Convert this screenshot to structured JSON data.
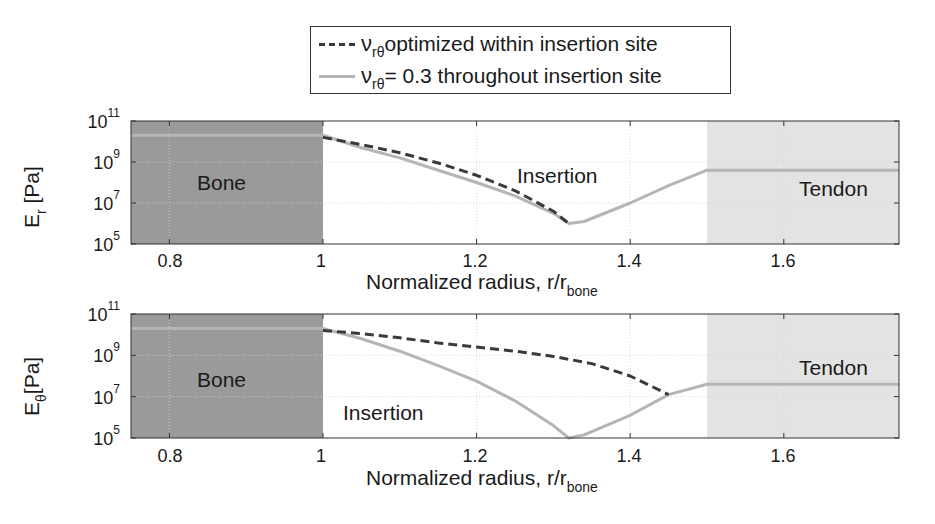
{
  "legend": {
    "entries": [
      {
        "symbol": "ν",
        "subscript": "rθ",
        "text": " optimized within insertion site",
        "style": "dashed",
        "color": "#3a3a3a"
      },
      {
        "symbol": "ν",
        "subscript": "rθ",
        "text": " = 0.3 throughout insertion site",
        "style": "solid",
        "color": "#b5b5b5"
      }
    ]
  },
  "colors": {
    "bone": "#9a9a9a",
    "tendon": "#e3e3e3",
    "dashed": "#3a3a3a",
    "solid": "#b5b5b5",
    "axis": "#333333",
    "grid": "#cfcfcf"
  },
  "panels": [
    {
      "ylabel_main": "E",
      "ylabel_sub": "r",
      "ylabel_unit": " [Pa]",
      "xlabel_main": "Normalized radius, r/r",
      "xlabel_sub": "bone",
      "y_ticks": [
        {
          "base": "10",
          "exp": "11"
        },
        {
          "base": "10",
          "exp": "9"
        },
        {
          "base": "10",
          "exp": "7"
        },
        {
          "base": "10",
          "exp": "5"
        }
      ],
      "x_ticks": [
        "0.8",
        "1",
        "1.2",
        "1.4",
        "1.6"
      ],
      "regions": {
        "bone": "Bone",
        "insertion": "Insertion",
        "tendon": "Tendon"
      }
    },
    {
      "ylabel_main": "E",
      "ylabel_sub": "θ",
      "ylabel_unit": "[Pa]",
      "xlabel_main": "Normalized radius, r/r",
      "xlabel_sub": "bone",
      "y_ticks": [
        {
          "base": "10",
          "exp": "11"
        },
        {
          "base": "10",
          "exp": "9"
        },
        {
          "base": "10",
          "exp": "7"
        },
        {
          "base": "10",
          "exp": "5"
        }
      ],
      "x_ticks": [
        "0.8",
        "1",
        "1.2",
        "1.4",
        "1.6"
      ],
      "regions": {
        "bone": "Bone",
        "insertion": "Insertion",
        "tendon": "Tendon"
      }
    }
  ],
  "chart_data": [
    {
      "type": "line",
      "title": "",
      "xlabel": "Normalized radius, r/r_bone",
      "ylabel": "E_r [Pa]",
      "yscale": "log",
      "xlim": [
        0.75,
        1.75
      ],
      "ylim": [
        100000.0,
        100000000000.0
      ],
      "grid": true,
      "legend_position": "top",
      "shaded_regions": [
        {
          "label": "Bone",
          "x": [
            0.75,
            1.0
          ],
          "color": "#9a9a9a"
        },
        {
          "label": "Tendon",
          "x": [
            1.5,
            1.75
          ],
          "color": "#e3e3e3"
        }
      ],
      "annotations": [
        "Bone",
        "Insertion",
        "Tendon"
      ],
      "series": [
        {
          "name": "ν_rθ optimized within insertion site",
          "style": "dashed",
          "x": [
            1.0,
            1.05,
            1.1,
            1.15,
            1.2,
            1.25,
            1.3,
            1.32
          ],
          "log10_y": [
            10.2,
            9.85,
            9.45,
            8.95,
            8.35,
            7.6,
            6.6,
            6.0
          ]
        },
        {
          "name": "ν_rθ = 0.3 throughout insertion site",
          "style": "solid",
          "x": [
            0.75,
            1.0,
            1.05,
            1.1,
            1.15,
            1.2,
            1.25,
            1.3,
            1.32,
            1.34,
            1.4,
            1.45,
            1.5,
            1.75
          ],
          "log10_y": [
            10.3,
            10.3,
            9.7,
            9.2,
            8.6,
            8.0,
            7.35,
            6.5,
            6.0,
            6.1,
            7.0,
            7.85,
            8.6,
            8.6
          ]
        }
      ]
    },
    {
      "type": "line",
      "title": "",
      "xlabel": "Normalized radius, r/r_bone",
      "ylabel": "E_θ [Pa]",
      "yscale": "log",
      "xlim": [
        0.75,
        1.75
      ],
      "ylim": [
        100000.0,
        100000000000.0
      ],
      "grid": true,
      "shaded_regions": [
        {
          "label": "Bone",
          "x": [
            0.75,
            1.0
          ],
          "color": "#9a9a9a"
        },
        {
          "label": "Tendon",
          "x": [
            1.5,
            1.75
          ],
          "color": "#e3e3e3"
        }
      ],
      "annotations": [
        "Bone",
        "Insertion",
        "Tendon"
      ],
      "series": [
        {
          "name": "ν_rθ optimized within insertion site",
          "style": "dashed",
          "x": [
            1.0,
            1.05,
            1.1,
            1.15,
            1.2,
            1.25,
            1.3,
            1.35,
            1.4,
            1.45
          ],
          "log10_y": [
            10.2,
            10.05,
            9.85,
            9.6,
            9.4,
            9.2,
            8.95,
            8.6,
            8.0,
            7.1
          ]
        },
        {
          "name": "ν_rθ = 0.3 throughout insertion site",
          "style": "solid",
          "x": [
            0.75,
            1.0,
            1.05,
            1.1,
            1.15,
            1.2,
            1.25,
            1.3,
            1.32,
            1.34,
            1.4,
            1.45,
            1.5,
            1.75
          ],
          "log10_y": [
            10.3,
            10.3,
            9.8,
            9.2,
            8.5,
            7.75,
            6.8,
            5.6,
            5.0,
            5.15,
            6.1,
            7.1,
            7.6,
            7.6
          ]
        }
      ]
    }
  ]
}
